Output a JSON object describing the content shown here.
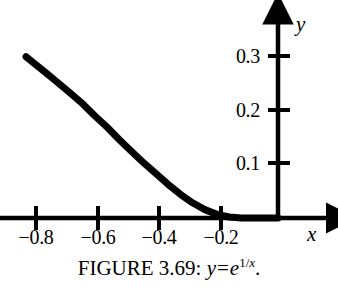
{
  "figure": {
    "caption_prefix": "FIGURE 3.69:",
    "caption_y": "y",
    "caption_equals": "=",
    "caption_base": "e",
    "caption_exp_num": "1",
    "caption_exp_slash": "/",
    "caption_exp_den": "x",
    "caption_period": ".",
    "axis_x_name": "x",
    "axis_y_name": "y",
    "line_color": "#000000",
    "axis_color": "#000000",
    "background_color": "#ffffff"
  },
  "chart_data": {
    "type": "line",
    "function": "y = e^(1/x)",
    "xlabel": "x",
    "ylabel": "y",
    "grid": false,
    "legend": "none",
    "xlim": [
      -0.91,
      0.19
    ],
    "ylim": [
      -0.015,
      0.38
    ],
    "xticks": [
      -0.8,
      -0.6,
      -0.4,
      -0.2
    ],
    "xtick_labels": [
      "−0.8",
      "−0.6",
      "−0.4",
      "−0.2"
    ],
    "yticks": [
      0.1,
      0.2,
      0.3
    ],
    "ytick_labels": [
      "0.1",
      "0.2",
      "0.3"
    ],
    "series": [
      {
        "name": "y = e^(1/x)",
        "x": [
          -0.826,
          -0.8,
          -0.76,
          -0.72,
          -0.68,
          -0.64,
          -0.6,
          -0.56,
          -0.52,
          -0.48,
          -0.44,
          -0.4,
          -0.36,
          -0.32,
          -0.28,
          -0.24,
          -0.2,
          -0.16,
          -0.12,
          -0.08,
          -0.04,
          0.0
        ],
        "y": [
          0.2985,
          0.2865,
          0.2684,
          0.2498,
          0.2308,
          0.2113,
          0.1889,
          0.168,
          0.145,
          0.1231,
          0.1019,
          0.0821,
          0.0622,
          0.0439,
          0.0282,
          0.0155,
          0.0067,
          0.0019,
          0.0002,
          0.0,
          0.0,
          0.0
        ]
      }
    ]
  },
  "axes": {
    "x_ticks": [
      {
        "label": "−0.8",
        "value": -0.8
      },
      {
        "label": "−0.6",
        "value": -0.6
      },
      {
        "label": "−0.4",
        "value": -0.4
      },
      {
        "label": "−0.2",
        "value": -0.2
      }
    ],
    "y_ticks": [
      {
        "label": "0.1",
        "value": 0.1
      },
      {
        "label": "0.2",
        "value": 0.2
      },
      {
        "label": "0.3",
        "value": 0.3
      }
    ]
  }
}
